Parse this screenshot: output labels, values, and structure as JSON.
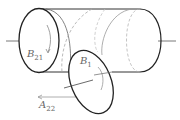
{
  "diagram": {
    "labels": {
      "b21": {
        "main": "B",
        "sub": "21"
      },
      "b1": {
        "main": "B",
        "sub": "1"
      },
      "a22": {
        "main": "A",
        "sub": "22"
      }
    },
    "colors": {
      "outline": "#222222",
      "hidden": "#999999",
      "label": "#666666"
    }
  }
}
